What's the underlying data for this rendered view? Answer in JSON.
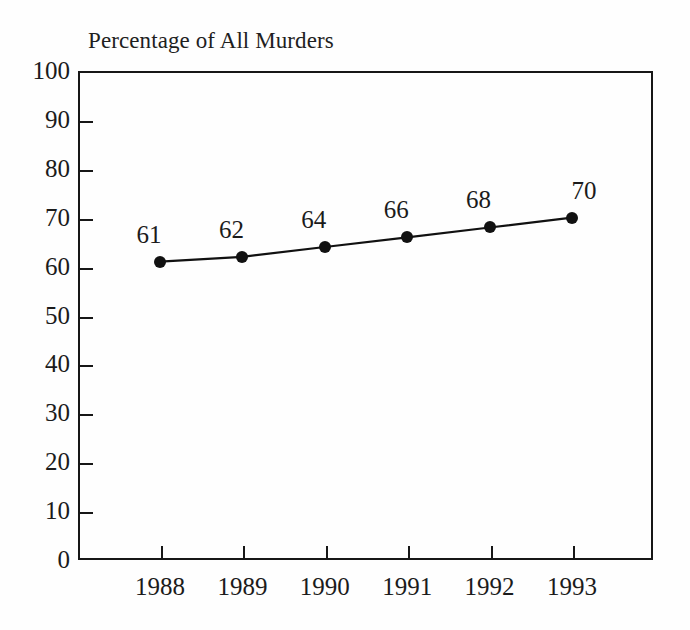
{
  "chart_data": {
    "type": "line",
    "title": "Percentage of All Murders",
    "xlabel": "",
    "ylabel": "",
    "categories": [
      "1988",
      "1989",
      "1990",
      "1991",
      "1992",
      "1993"
    ],
    "values": [
      61,
      62,
      64,
      66,
      68,
      70
    ],
    "point_labels": [
      "61",
      "62",
      "64",
      "66",
      "68",
      "70"
    ],
    "ylim": [
      0,
      100
    ],
    "ytick_labels": [
      "100",
      "90",
      "80",
      "70",
      "60",
      "50",
      "40",
      "30",
      "20",
      "10",
      "0"
    ],
    "ytick_values": [
      100,
      90,
      80,
      70,
      60,
      50,
      40,
      30,
      20,
      10,
      0
    ],
    "grid": false,
    "legend": null,
    "legend_position": "none",
    "series": [
      {
        "name": "Percentage of All Murders",
        "values": [
          61,
          62,
          64,
          66,
          68,
          70
        ],
        "marker": "filled-circle",
        "color": "#111111"
      }
    ],
    "colors": {
      "line": "#111111",
      "marker": "#111111",
      "axis": "#171717",
      "text": "#1b1b1b",
      "background": "#fefefe"
    }
  }
}
